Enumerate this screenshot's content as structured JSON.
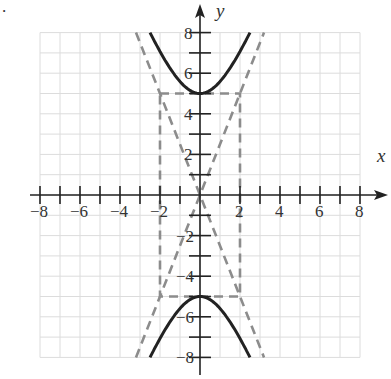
{
  "figure": {
    "bullet": "."
  },
  "chart_data": {
    "type": "line",
    "title": "",
    "xlabel": "x",
    "ylabel": "y",
    "xlim": [
      -8,
      8
    ],
    "ylim": [
      -8,
      8
    ],
    "grid": true,
    "x_ticks": [
      -8,
      -6,
      -4,
      -2,
      2,
      4,
      6,
      8
    ],
    "y_ticks": [
      8,
      6,
      4,
      2,
      -2,
      -4,
      -6,
      -8
    ],
    "x_tick_labels": [
      "−8",
      "−6",
      "−4",
      "−2",
      "2",
      "4",
      "6",
      "8"
    ],
    "y_tick_labels": [
      "8",
      "6",
      "4",
      "2",
      "−2",
      "−4",
      "−6",
      "−8"
    ],
    "series": [
      {
        "name": "hyperbola upper branch",
        "style": "solid",
        "equation": "y^2/25 - x^2/4 = 1",
        "vertex": [
          0,
          5
        ]
      },
      {
        "name": "hyperbola lower branch",
        "style": "solid",
        "equation": "y^2/25 - x^2/4 = 1",
        "vertex": [
          0,
          -5
        ]
      },
      {
        "name": "asymptote",
        "style": "dashed",
        "equation": "y = 2.5x"
      },
      {
        "name": "asymptote",
        "style": "dashed",
        "equation": "y = -2.5x"
      },
      {
        "name": "fundamental rectangle",
        "style": "dashed",
        "corners": [
          [
            -2,
            5
          ],
          [
            2,
            5
          ],
          [
            2,
            -5
          ],
          [
            -2,
            -5
          ]
        ]
      }
    ]
  }
}
